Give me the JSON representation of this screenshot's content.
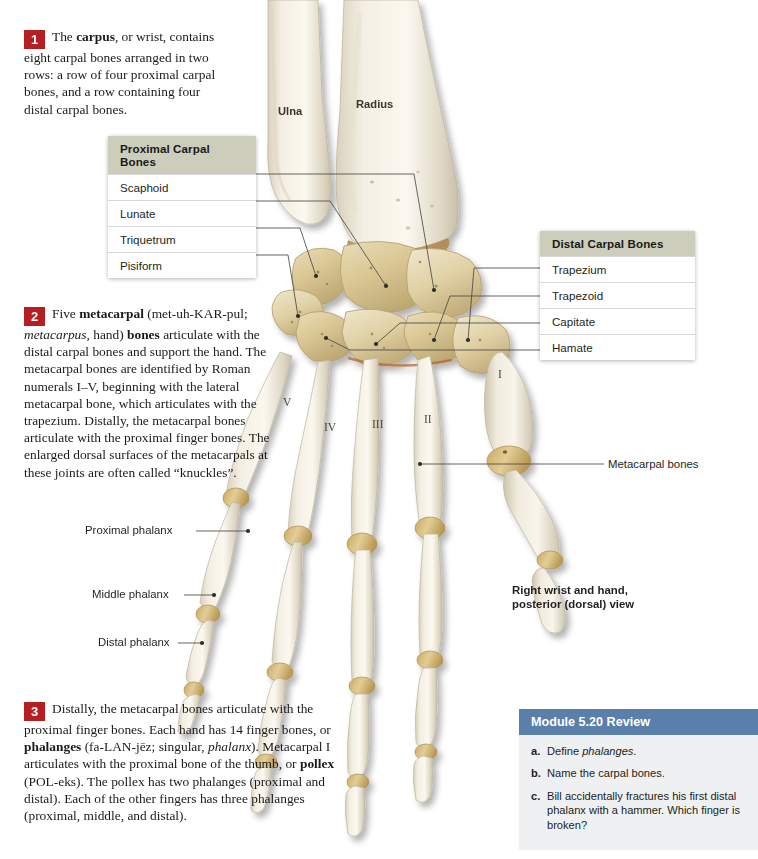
{
  "figure": {
    "view_caption_line1": "Right wrist and hand,",
    "view_caption_line2": "posterior (dorsal) view",
    "bone_labels": {
      "ulna": "Ulna",
      "radius": "Radius",
      "metacarpal_bones": "Metacarpal bones",
      "proximal_phalanx": "Proximal phalanx",
      "middle_phalanx": "Middle phalanx",
      "distal_phalanx": "Distal phalanx"
    },
    "roman_numerals": [
      "I",
      "II",
      "III",
      "IV",
      "V"
    ]
  },
  "tables": {
    "proximal": {
      "header": "Proximal Carpal Bones",
      "rows": [
        "Scaphoid",
        "Lunate",
        "Triquetrum",
        "Pisiform"
      ]
    },
    "distal": {
      "header": "Distal Carpal Bones",
      "rows": [
        "Trapezium",
        "Trapezoid",
        "Capitate",
        "Hamate"
      ]
    }
  },
  "paragraphs": [
    {
      "number": "1",
      "html": "The <b>carpus</b>, or wrist, contains eight carpal bones arranged in two rows: a row of four proximal carpal bones, and a row containing four distal carpal bones."
    },
    {
      "number": "2",
      "html": "Five <b>metacarpal</b> (met-uh-KAR-pul; <i>metacarpus</i>, hand) <b>bones</b> articulate with the distal carpal bones and support the hand. The metacarpal bones are identified by Roman numerals I&#8211;V, beginning with the lateral metacarpal bone, which articulates with the trapezium. Distally, the metacarpal bones articulate with the proximal finger bones. The enlarged dorsal surfaces of the metacarpals at these joints are often called &#8220;knuckles&#8221;."
    },
    {
      "number": "3",
      "html": "Distally, the metacarpal bones articulate with the proximal finger bones. Each hand has 14 finger bones, or <b>phalanges</b> (fa-LAN-j&#275;z; singular, <i>phalanx</i>). Metacarpal I articulates with the proximal bone of the thumb, or <b>pollex</b> (POL-eks). The pollex has two phalanges (proximal and distal). Each of the other fingers has three phalanges (proximal, middle, and distal)."
    }
  ],
  "review": {
    "header": "Module 5.20 Review",
    "items": [
      {
        "letter": "a.",
        "html": "Define <i>phalanges</i>."
      },
      {
        "letter": "b.",
        "html": "Name the carpal bones."
      },
      {
        "letter": "c.",
        "html": "Bill accidentally fractures his first distal phalanx with a hammer. Which finger is broken?"
      }
    ]
  },
  "colors": {
    "marker_red": "#b51f23",
    "table_header": "#cdcdbb",
    "review_header": "#5b7fab",
    "review_body": "#eef0f2",
    "bone_light": "#f2ede1",
    "bone_shadow": "#cfc5ae",
    "carpal_tan": "#d9c38d",
    "leader_line": "#4a4a4a"
  }
}
